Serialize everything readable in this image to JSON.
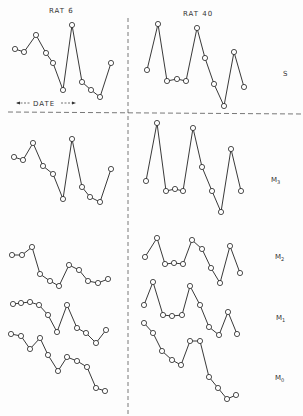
{
  "titles": {
    "left": "RAT 6",
    "right": "RAT 40"
  },
  "date_label": "DATE",
  "row_labels": [
    "S",
    "M3",
    "M2",
    "M1",
    "M0"
  ],
  "chart_data": {
    "type": "line",
    "title": "",
    "columns": [
      "RAT 6",
      "RAT 40"
    ],
    "rows": [
      "S",
      "M3",
      "M2",
      "M1",
      "M0"
    ],
    "xlabel": "DATE",
    "ylabel": "",
    "series": [
      {
        "name": "RAT 6 - S",
        "points": [
          [
            15,
            49
          ],
          [
            24,
            52
          ],
          [
            36,
            35
          ],
          [
            46,
            53
          ],
          [
            53,
            63
          ],
          [
            63,
            90
          ],
          [
            72,
            25
          ],
          [
            82,
            82
          ],
          [
            91,
            90
          ],
          [
            100,
            97
          ],
          [
            111,
            63
          ]
        ]
      },
      {
        "name": "RAT 40 - S",
        "points": [
          [
            147,
            70
          ],
          [
            158,
            24
          ],
          [
            167,
            81
          ],
          [
            177,
            79
          ],
          [
            186,
            81
          ],
          [
            197,
            28
          ],
          [
            205,
            58
          ],
          [
            214,
            84
          ],
          [
            224,
            106
          ],
          [
            234,
            52
          ],
          [
            244,
            87
          ]
        ]
      },
      {
        "name": "RAT 6 - M3",
        "points": [
          [
            14,
            157
          ],
          [
            23,
            160
          ],
          [
            33,
            143
          ],
          [
            43,
            166
          ],
          [
            53,
            174
          ],
          [
            63,
            199
          ],
          [
            72,
            139
          ],
          [
            82,
            187
          ],
          [
            90,
            197
          ],
          [
            100,
            202
          ],
          [
            111,
            169
          ]
        ]
      },
      {
        "name": "RAT 40 - M3",
        "points": [
          [
            146,
            181
          ],
          [
            157,
            123
          ],
          [
            166,
            191
          ],
          [
            175,
            189
          ],
          [
            183,
            191
          ],
          [
            193,
            128
          ],
          [
            202,
            167
          ],
          [
            212,
            191
          ],
          [
            221,
            212
          ],
          [
            231,
            149
          ],
          [
            241,
            191
          ]
        ]
      },
      {
        "name": "RAT 6 - M2",
        "points": [
          [
            12,
            255
          ],
          [
            22,
            255
          ],
          [
            32,
            247
          ],
          [
            40,
            274
          ],
          [
            50,
            281
          ],
          [
            59,
            286
          ],
          [
            69,
            265
          ],
          [
            79,
            270
          ],
          [
            88,
            281
          ],
          [
            98,
            283
          ],
          [
            108,
            279
          ]
        ]
      },
      {
        "name": "RAT 40 - M2",
        "points": [
          [
            145,
            257
          ],
          [
            157,
            238
          ],
          [
            165,
            264
          ],
          [
            174,
            263
          ],
          [
            183,
            264
          ],
          [
            192,
            240
          ],
          [
            202,
            249
          ],
          [
            211,
            268
          ],
          [
            220,
            283
          ],
          [
            230,
            246
          ],
          [
            240,
            273
          ]
        ]
      },
      {
        "name": "RAT 6 - M1",
        "points": [
          [
            13,
            304
          ],
          [
            21,
            303
          ],
          [
            30,
            302
          ],
          [
            39,
            305
          ],
          [
            48,
            315
          ],
          [
            57,
            332
          ],
          [
            67,
            305
          ],
          [
            77,
            328
          ],
          [
            86,
            333
          ],
          [
            96,
            343
          ],
          [
            106,
            330
          ]
        ]
      },
      {
        "name": "RAT 40 - M1",
        "points": [
          [
            144,
            305
          ],
          [
            153,
            282
          ],
          [
            163,
            315
          ],
          [
            172,
            316
          ],
          [
            182,
            315
          ],
          [
            190,
            286
          ],
          [
            200,
            305
          ],
          [
            209,
            327
          ],
          [
            219,
            335
          ],
          [
            228,
            312
          ],
          [
            237,
            334
          ]
        ]
      },
      {
        "name": "RAT 6 - M0",
        "points": [
          [
            11,
            334
          ],
          [
            21,
            336
          ],
          [
            30,
            349
          ],
          [
            40,
            338
          ],
          [
            48,
            355
          ],
          [
            58,
            371
          ],
          [
            67,
            357
          ],
          [
            77,
            361
          ],
          [
            87,
            367
          ],
          [
            96,
            388
          ],
          [
            105,
            391
          ]
        ]
      },
      {
        "name": "RAT 40 - M0",
        "points": [
          [
            144,
            323
          ],
          [
            153,
            333
          ],
          [
            162,
            351
          ],
          [
            172,
            360
          ],
          [
            181,
            365
          ],
          [
            190,
            341
          ],
          [
            200,
            341
          ],
          [
            209,
            377
          ],
          [
            218,
            388
          ],
          [
            227,
            399
          ],
          [
            236,
            395
          ]
        ]
      }
    ]
  }
}
